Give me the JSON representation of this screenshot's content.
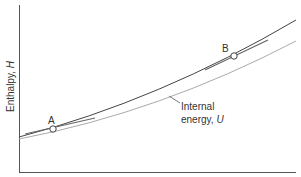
{
  "diagram": {
    "y_axis_label": "Enthalpy, ",
    "y_axis_symbol": "H",
    "curve_U_label_line1": "Internal",
    "curve_U_label_line2": "energy, ",
    "curve_U_symbol": "U",
    "point_A": "A",
    "point_B": "B",
    "colors": {
      "H_curve": "#444444",
      "U_curve": "#aaaaaa",
      "axis": "#555555",
      "tangent": "#666666"
    }
  }
}
